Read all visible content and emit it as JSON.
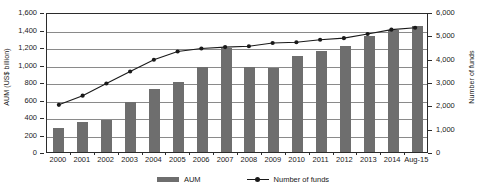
{
  "chart_data": {
    "type": "bar",
    "title": "",
    "subtitle": "",
    "categories": [
      "2000",
      "2001",
      "2002",
      "2003",
      "2004",
      "2005",
      "2006",
      "2007",
      "2008",
      "2009",
      "2010",
      "2011",
      "2012",
      "2013",
      "2014",
      "Aug-15"
    ],
    "xlabel": "",
    "grid": true,
    "legend_position": "bottom",
    "axes": {
      "left": {
        "label": "AUM (US$ billion)",
        "ticks": [
          "0",
          "200",
          "400",
          "600",
          "800",
          "1,000",
          "1,200",
          "1,400",
          "1,600"
        ],
        "tick_values": [
          0,
          200,
          400,
          600,
          800,
          1000,
          1200,
          1400,
          1600
        ],
        "ylim": [
          0,
          1600
        ]
      },
      "right": {
        "label": "Number of funds",
        "ticks": [
          "0",
          "1,000",
          "2,000",
          "3,000",
          "4,000",
          "5,000",
          "6,000"
        ],
        "tick_values": [
          0,
          1000,
          2000,
          3000,
          4000,
          5000,
          6000
        ],
        "ylim": [
          0,
          6000
        ]
      }
    },
    "series": [
      {
        "name": "AUM",
        "type": "bar",
        "axis": "left",
        "color": "#6e6e6e",
        "values": [
          270,
          340,
          365,
          570,
          725,
          800,
          970,
          1190,
          970,
          955,
          1100,
          1160,
          1210,
          1330,
          1400,
          1440
        ]
      },
      {
        "name": "Number of funds",
        "type": "line",
        "axis": "right",
        "color": "#1a1a1a",
        "values": [
          2050,
          2450,
          2980,
          3500,
          4010,
          4370,
          4500,
          4560,
          4600,
          4740,
          4770,
          4880,
          4950,
          5130,
          5320,
          5400
        ]
      }
    ],
    "legend": [
      {
        "label": "AUM",
        "marker": "bar-swatch"
      },
      {
        "label": "Number of funds",
        "marker": "line-marker-swatch"
      }
    ]
  }
}
